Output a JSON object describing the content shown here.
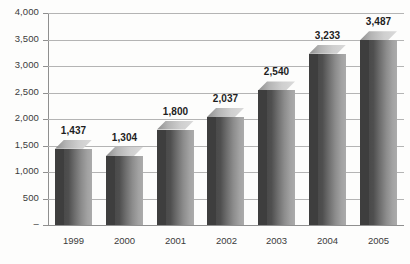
{
  "chart_data": {
    "type": "bar",
    "title": "",
    "subtitle": "",
    "xlabel": "",
    "ylabel": "",
    "categories": [
      "1999",
      "2000",
      "2001",
      "2002",
      "2003",
      "2004",
      "2005"
    ],
    "values": [
      1437,
      1304,
      1800,
      2037,
      2540,
      3233,
      3487
    ],
    "value_labels": [
      "1,437",
      "1,304",
      "1,800",
      "2,037",
      "2,540",
      "3,233",
      "3,487"
    ],
    "ylim": [
      0,
      4000
    ],
    "ytick_values": [
      0,
      500,
      1000,
      1500,
      2000,
      2500,
      3000,
      3500,
      4000
    ],
    "ytick_labels": [
      "–",
      "500",
      "1,000",
      "1,500",
      "2,000",
      "2,500",
      "3,000",
      "3,500",
      "4,000"
    ],
    "grid": true,
    "grid_axis": "y",
    "legend": false,
    "legend_position": "bottom",
    "series": [
      {
        "name": "",
        "values": [
          1437,
          1304,
          1800,
          2037,
          2540,
          3233,
          3487
        ]
      }
    ],
    "style": {
      "bar_style": "3d-column",
      "bar_face_dark": "#4a4a4a",
      "bar_face_light": "#ababab",
      "bar_side_color": "#3e3e3e",
      "bar_top_color": "#d0d0d0",
      "gridline_color": "#b4b4b4",
      "axis_color": "#8f8f8f",
      "text_color": "#3b3b3b",
      "label_color": "#1e1e1e",
      "background": "#fdfdfc"
    }
  },
  "footer": {
    "cropped_legend_text": ""
  }
}
